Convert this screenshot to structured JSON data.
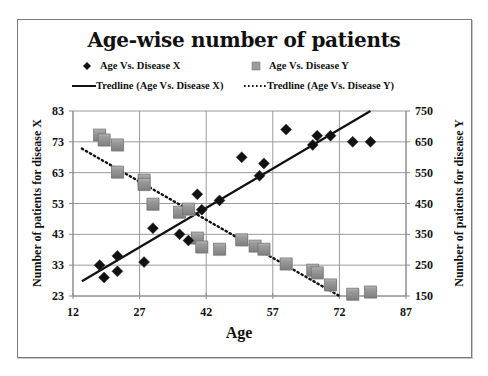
{
  "chart": {
    "title": "Age-wise number of patients",
    "legend": [
      {
        "label": "Age Vs. Disease X",
        "marker": "diamond",
        "color": "#111111"
      },
      {
        "label": "Age Vs. Disease Y",
        "marker": "square",
        "color": "#8c8c8c"
      },
      {
        "label": "Tredline (Age Vs. Disease X)",
        "marker": "solid-line",
        "color": "#111111"
      },
      {
        "label": "Tredline (Age Vs. Disease Y)",
        "marker": "dotted-line",
        "color": "#111111"
      }
    ],
    "xlabel": "Age",
    "ylabel_left": "Number of patients for disease X",
    "ylabel_right": "Number of patients for disease Y",
    "x_ticks": [
      "12",
      "27",
      "42",
      "57",
      "72",
      "87"
    ],
    "y_left_ticks": [
      "23",
      "33",
      "43",
      "53",
      "63",
      "73",
      "83"
    ],
    "y_right_ticks": [
      "150",
      "250",
      "350",
      "450",
      "550",
      "650",
      "750"
    ]
  },
  "chart_data": {
    "type": "scatter",
    "title": "Age-wise number of patients",
    "xlabel": "Age",
    "ylabel": "Number of patients for disease X",
    "ylabel_secondary": "Number of patients for disease Y",
    "xlim": [
      12,
      87
    ],
    "ylim": [
      23,
      83
    ],
    "ylim_secondary": [
      150,
      750
    ],
    "x_ticks": [
      12,
      27,
      42,
      57,
      72,
      87
    ],
    "y_ticks": [
      23,
      33,
      43,
      53,
      63,
      73,
      83
    ],
    "y_ticks_secondary": [
      150,
      250,
      350,
      450,
      550,
      650,
      750
    ],
    "grid": true,
    "legend_position": "top",
    "series": [
      {
        "name": "Age Vs. Disease X",
        "axis": "left",
        "marker": "diamond",
        "points": [
          [
            18,
            33
          ],
          [
            19,
            29
          ],
          [
            22,
            36
          ],
          [
            22,
            31
          ],
          [
            28,
            34
          ],
          [
            30,
            45
          ],
          [
            36,
            43
          ],
          [
            38,
            41
          ],
          [
            40,
            56
          ],
          [
            41,
            51
          ],
          [
            45,
            54
          ],
          [
            50,
            68
          ],
          [
            54,
            62
          ],
          [
            55,
            66
          ],
          [
            60,
            77
          ],
          [
            66,
            72
          ],
          [
            67,
            75
          ],
          [
            70,
            75
          ],
          [
            75,
            73
          ],
          [
            79,
            73
          ]
        ]
      },
      {
        "name": "Age Vs. Disease Y",
        "axis": "right",
        "marker": "square",
        "points": [
          [
            18,
            672
          ],
          [
            19,
            656
          ],
          [
            22,
            640
          ],
          [
            22,
            552
          ],
          [
            28,
            526
          ],
          [
            28,
            512
          ],
          [
            30,
            448
          ],
          [
            36,
            422
          ],
          [
            38,
            432
          ],
          [
            40,
            338
          ],
          [
            41,
            309
          ],
          [
            45,
            302
          ],
          [
            50,
            332
          ],
          [
            53,
            312
          ],
          [
            55,
            302
          ],
          [
            60,
            254
          ],
          [
            66,
            234
          ],
          [
            67,
            225
          ],
          [
            70,
            186
          ],
          [
            75,
            156
          ],
          [
            79,
            163
          ]
        ]
      },
      {
        "name": "Tredline (Age Vs. Disease X)",
        "axis": "left",
        "type": "line",
        "style": "solid",
        "points": [
          [
            14,
            27.8
          ],
          [
            79,
            83
          ]
        ]
      },
      {
        "name": "Tredline (Age Vs. Disease Y)",
        "axis": "right",
        "type": "line",
        "style": "dotted",
        "points": [
          [
            14,
            628
          ],
          [
            72,
            150
          ]
        ]
      }
    ]
  }
}
